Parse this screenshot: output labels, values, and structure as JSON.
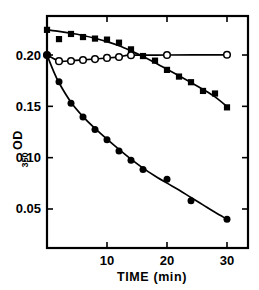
{
  "chart_data": {
    "type": "scatter",
    "title": "",
    "xlabel": "TIME  (min)",
    "ylabel": "OD",
    "ylabel_subscript": "350",
    "xlim": [
      0,
      33.5
    ],
    "ylim": [
      0.012,
      0.238
    ],
    "xticks": [
      10,
      20,
      30
    ],
    "xtick_labels": [
      "10",
      "20",
      "30"
    ],
    "yticks": [
      0.05,
      0.1,
      0.15,
      0.2
    ],
    "ytick_labels": [
      "0.05",
      "0.10",
      "0.15",
      "0.20"
    ],
    "grid": false,
    "legend": "none",
    "frame": "box",
    "ticks_inward": true,
    "ticks_mirrored": true,
    "series": [
      {
        "name": "filled-squares",
        "marker": "filled-square",
        "color": "#000000",
        "x": [
          0,
          2,
          4,
          6,
          8,
          10,
          12,
          14,
          16,
          18,
          20,
          22,
          24,
          26,
          28,
          30
        ],
        "y": [
          0.2245,
          0.2155,
          0.2205,
          0.2175,
          0.216,
          0.215,
          0.212,
          0.2055,
          0.199,
          0.1945,
          0.1855,
          0.179,
          0.1735,
          0.165,
          0.1625,
          0.149
        ],
        "curve_x": [
          0,
          2,
          4,
          6,
          8,
          10,
          12,
          14,
          16,
          18,
          20,
          22,
          24,
          26,
          28,
          30
        ],
        "curve_y": [
          0.2245,
          0.223,
          0.2212,
          0.219,
          0.2163,
          0.213,
          0.209,
          0.204,
          0.1985,
          0.1925,
          0.1862,
          0.1798,
          0.1732,
          0.1665,
          0.1592,
          0.1498
        ]
      },
      {
        "name": "open-circles",
        "marker": "open-circle",
        "color": "#000000",
        "x": [
          0,
          2,
          4,
          6,
          8,
          10,
          12,
          14,
          20,
          30
        ],
        "y": [
          0.2,
          0.194,
          0.1942,
          0.1952,
          0.196,
          0.1972,
          0.198,
          0.1998,
          0.2,
          0.2002
        ],
        "curve_x": [
          0,
          2,
          4,
          6,
          8,
          10,
          12,
          14,
          20,
          30
        ],
        "curve_y": [
          0.2,
          0.1942,
          0.1945,
          0.1952,
          0.1961,
          0.1971,
          0.1982,
          0.1998,
          0.2,
          0.2002
        ]
      },
      {
        "name": "filled-circles",
        "marker": "filled-circle",
        "color": "#000000",
        "x": [
          0,
          2,
          4,
          6,
          8,
          10,
          12,
          14,
          16,
          20,
          24,
          30
        ],
        "y": [
          0.2,
          0.174,
          0.153,
          0.1395,
          0.1275,
          0.1175,
          0.1065,
          0.0975,
          0.0885,
          0.079,
          0.058,
          0.04
        ],
        "curve_x": [
          0,
          1,
          2,
          4,
          6,
          8,
          10,
          12,
          14,
          16,
          18,
          20,
          22,
          24,
          26,
          28,
          30
        ],
        "curve_y": [
          0.2,
          0.1855,
          0.173,
          0.154,
          0.14,
          0.1285,
          0.118,
          0.108,
          0.0985,
          0.0898,
          0.0822,
          0.0752,
          0.0685,
          0.0612,
          0.054,
          0.0468,
          0.04
        ]
      }
    ]
  },
  "axis": {
    "y_title": "OD",
    "y_title_sub": "350",
    "x_title": "TIME  (min)"
  }
}
